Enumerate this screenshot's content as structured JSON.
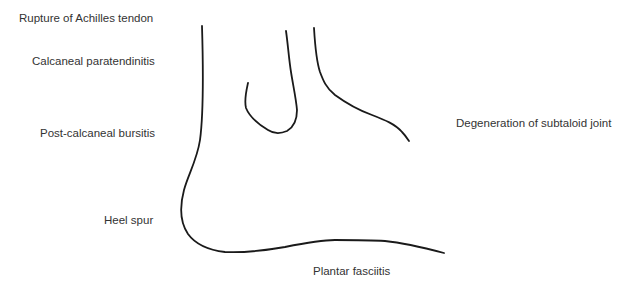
{
  "diagram": {
    "line_color": "#1a1a1a",
    "text_color": "#333333",
    "background": "#ffffff"
  },
  "labels": {
    "achilles_rupture": "Rupture of Achilles tendon",
    "paratendinitis": "Calcaneal paratendinitis",
    "bursitis": "Post-calcaneal bursitis",
    "heel_spur": "Heel spur",
    "subtaloid": "Degeneration of subtaloid joint",
    "plantar": "Plantar fasciitis"
  }
}
